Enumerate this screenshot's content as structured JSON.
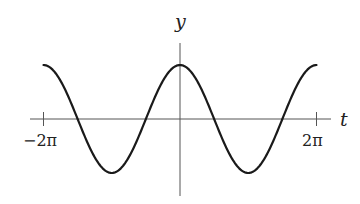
{
  "chart_data": {
    "type": "line",
    "title": "",
    "function": "y = cos(t)",
    "xlabel": "t",
    "ylabel": "y",
    "xlim": [
      -6.2832,
      6.2832
    ],
    "ylim": [
      -1,
      1
    ],
    "x_ticks": [
      {
        "value": -6.2832,
        "label": "−2π"
      },
      {
        "value": 6.2832,
        "label": "2π"
      }
    ],
    "y_ticks": [],
    "grid": false,
    "legend": null,
    "series": [
      {
        "name": "cos(t)",
        "x": [
          -6.2832,
          -4.7124,
          -3.1416,
          -1.5708,
          0,
          1.5708,
          3.1416,
          4.7124,
          6.2832
        ],
        "values": [
          1,
          0,
          -1,
          0,
          1,
          0,
          -1,
          0,
          1
        ],
        "color": "#1a1a1a"
      }
    ],
    "key_points": {
      "maxima": [
        [
          -6.2832,
          1
        ],
        [
          0,
          1
        ],
        [
          6.2832,
          1
        ]
      ],
      "minima": [
        [
          -3.1416,
          -1
        ],
        [
          3.1416,
          -1
        ]
      ],
      "zeros": [
        -4.7124,
        -1.5708,
        1.5708,
        4.7124
      ]
    }
  },
  "labels": {
    "x_axis": "t",
    "y_axis": "y",
    "tick_left": "−2π",
    "tick_right": "2π"
  },
  "layout": {
    "origin_px": [
      180,
      119
    ],
    "x_unit_px_per_2pi": 136.5,
    "amplitude_px": 54
  }
}
